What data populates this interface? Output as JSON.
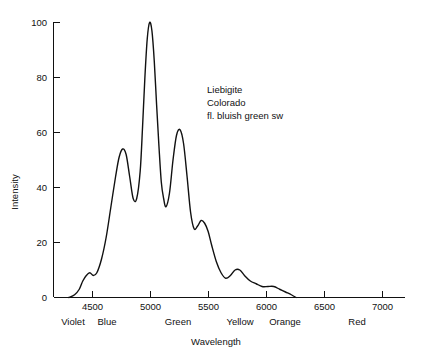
{
  "chart_data": {
    "type": "line",
    "title": "",
    "xlabel": "Wavelength",
    "ylabel": "Intensity",
    "xlim": [
      4250,
      7250
    ],
    "ylim": [
      0,
      100
    ],
    "grid": false,
    "legend": "none",
    "x_ticks": [
      4500,
      5000,
      5500,
      6000,
      6500,
      7000
    ],
    "x_tick_labels": [
      "4500",
      "5000",
      "5500",
      "6000",
      "6500",
      "7000"
    ],
    "y_ticks": [
      0,
      20,
      40,
      60,
      80,
      100
    ],
    "y_tick_labels": [
      "0",
      "20",
      "40",
      "60",
      "80",
      "100"
    ],
    "band_labels": [
      {
        "label": "Violet",
        "x": 4330
      },
      {
        "label": "Blue",
        "x": 4620
      },
      {
        "label": "Green",
        "x": 5230
      },
      {
        "label": "Yellow",
        "x": 5760
      },
      {
        "label": "Orange",
        "x": 5980
      },
      {
        "label": "Red",
        "x": 6600
      }
    ],
    "annotations": [
      "Liebigite",
      "Colorado",
      "fl. bluish green sw"
    ],
    "series": [
      {
        "name": "Liebigite emission spectrum",
        "x": [
          4380,
          4430,
          4470,
          4500,
          4530,
          4560,
          4590,
          4620,
          4660,
          4700,
          4740,
          4780,
          4810,
          4840,
          4870,
          4900,
          4930,
          4960,
          4990,
          5010,
          5030,
          5050,
          5070,
          5090,
          5110,
          5130,
          5150,
          5170,
          5190,
          5210,
          5240,
          5270,
          5300,
          5330,
          5360,
          5390,
          5420,
          5450,
          5480,
          5510,
          5540,
          5570,
          5600,
          5640,
          5680,
          5720,
          5760,
          5800,
          5840,
          5880,
          5930,
          5980,
          6030,
          6080,
          6130,
          6180,
          6230,
          6280,
          6320
        ],
        "y": [
          0,
          1,
          3,
          6,
          8,
          9,
          8,
          9,
          14,
          22,
          33,
          44,
          51,
          54,
          52,
          44,
          36,
          36,
          46,
          62,
          80,
          94,
          100,
          97,
          86,
          70,
          55,
          42,
          36,
          33,
          38,
          50,
          59,
          61,
          56,
          44,
          31,
          25,
          26,
          28,
          27,
          24,
          19,
          13,
          9,
          7,
          8,
          10,
          10,
          8,
          6,
          5,
          4,
          4,
          4,
          3,
          2,
          1,
          0
        ]
      }
    ]
  }
}
